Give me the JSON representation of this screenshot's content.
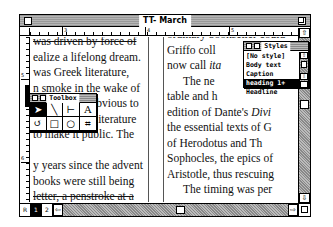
{
  "window": {
    "title": "TT- March"
  },
  "ruler": {
    "h_labels": [
      "3",
      "4",
      "5"
    ],
    "v_labels": [
      "5",
      "6"
    ]
  },
  "left_column": {
    "lines": [
      "was driven by force of",
      "ealize a lifelong dream.",
      " was Greek literature,",
      "n smoke in the wake of",
      "                    obvious to",
      "                   s literature",
      "to make it public.  The",
      "",
      "y years since the advent",
      " books were still being",
      "letter, a penstroke at a"
    ]
  },
  "right_column": {
    "lines": [
      "ordinary bookseller could",
      "Griffo coll",
      "now call ita",
      "The ne",
      "table and h",
      "edition of Dante's Divi",
      "the essential texts of G",
      "of Herodotus and Th",
      "Sophocles, the epics of",
      "Aristotle, thus rescuing",
      "The timing was per"
    ],
    "italic_fragments": [
      "ita",
      "Divi"
    ]
  },
  "toolbox": {
    "title": "Toolbox",
    "tools": [
      {
        "name": "pointer-tool",
        "glyph": "➤",
        "active": true
      },
      {
        "name": "diagonal-line-tool",
        "glyph": "╲",
        "active": false
      },
      {
        "name": "perpendicular-line-tool",
        "glyph": "⊢",
        "active": false
      },
      {
        "name": "text-tool",
        "glyph": "A",
        "active": false
      },
      {
        "name": "rotate-tool",
        "glyph": "↺",
        "active": false
      },
      {
        "name": "rectangle-tool",
        "glyph": "□",
        "active": false
      },
      {
        "name": "ellipse-tool",
        "glyph": "○",
        "active": false
      },
      {
        "name": "crop-tool",
        "glyph": "⌗",
        "active": false
      }
    ]
  },
  "styles_palette": {
    "title": "Styles",
    "items": [
      {
        "label": "[No style]",
        "selected": false
      },
      {
        "label": "Body text",
        "selected": false
      },
      {
        "label": "Caption",
        "selected": false
      },
      {
        "label": "heading 1+",
        "selected": true
      },
      {
        "label": "Headline",
        "selected": false
      }
    ]
  },
  "pages": {
    "master_label": "R",
    "page_buttons": [
      {
        "label": "1",
        "active": true
      },
      {
        "label": "2",
        "active": false
      }
    ]
  },
  "icons": {
    "up_arrow": "⇧",
    "down_arrow": "⇩",
    "left_arrow": "⇦",
    "right_arrow": "⇨"
  }
}
